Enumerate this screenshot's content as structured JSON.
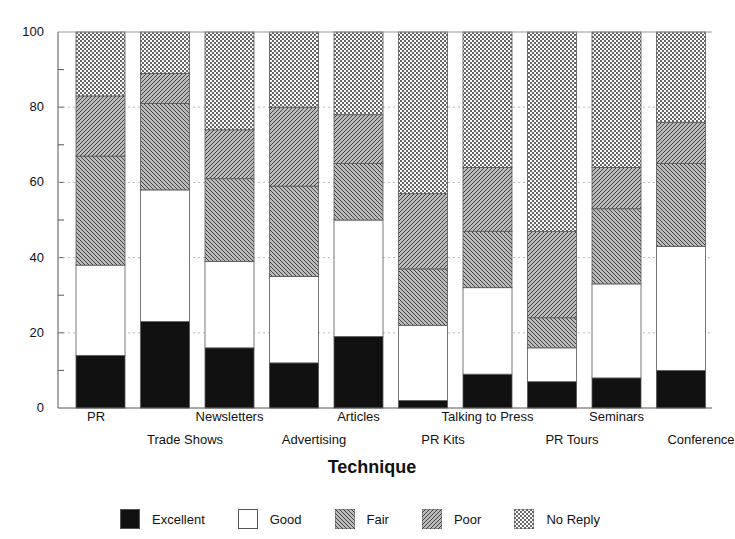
{
  "chart_data": {
    "type": "bar",
    "stacked": true,
    "title": "",
    "xlabel": "Technique",
    "ylabel": "",
    "ylim": [
      0,
      100
    ],
    "yticks": [
      0,
      20,
      40,
      60,
      80,
      100
    ],
    "grid": "horizontal dotted at 20-unit intervals",
    "legend_position": "bottom",
    "categories": [
      "PR",
      "Trade Shows",
      "Newsletters",
      "Advertising",
      "Articles",
      "PR Kits",
      "Talking to Press",
      "PR Tours",
      "Seminars",
      "Conference"
    ],
    "series": [
      {
        "name": "Excellent",
        "pattern": "solid-black",
        "values": [
          14,
          23,
          16,
          12,
          19,
          2,
          9,
          7,
          8,
          10
        ]
      },
      {
        "name": "Good",
        "pattern": "white",
        "values": [
          24,
          35,
          23,
          23,
          31,
          20,
          23,
          9,
          25,
          33
        ]
      },
      {
        "name": "Fair",
        "pattern": "hatch-backslash",
        "values": [
          29,
          23,
          22,
          24,
          15,
          15,
          15,
          8,
          20,
          22
        ]
      },
      {
        "name": "Poor",
        "pattern": "hatch-slash",
        "values": [
          16,
          8,
          13,
          21,
          13,
          20,
          17,
          23,
          11,
          11
        ]
      },
      {
        "name": "No Reply",
        "pattern": "crosshatch",
        "values": [
          17,
          11,
          26,
          20,
          22,
          43,
          36,
          53,
          36,
          24
        ]
      }
    ]
  },
  "legend": [
    "Excellent",
    "Good",
    "Fair",
    "Poor",
    "No Reply"
  ],
  "colors": {
    "excellent": "#111111",
    "good": "#ffffff",
    "hatch": "#555555"
  }
}
